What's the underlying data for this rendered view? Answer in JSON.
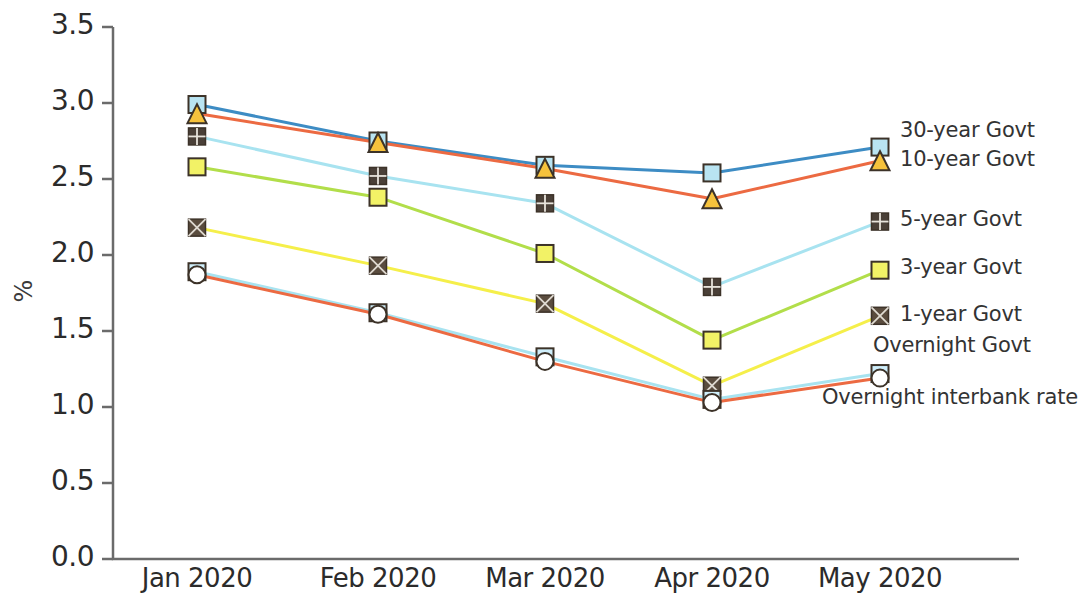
{
  "chart_data": {
    "type": "line",
    "title": "",
    "xlabel": "",
    "ylabel": "%",
    "categories": [
      "Jan 2020",
      "Feb 2020",
      "Mar 2020",
      "Apr 2020",
      "May 2020"
    ],
    "ylim": [
      0.0,
      3.5
    ],
    "yticks": [
      "0.0",
      "0.5",
      "1.0",
      "1.5",
      "2.0",
      "2.5",
      "3.0",
      "3.5"
    ],
    "ytick_values": [
      0.0,
      0.5,
      1.0,
      1.5,
      2.0,
      2.5,
      3.0,
      3.5
    ],
    "grid": false,
    "legend_position": "right",
    "series": [
      {
        "name": "30-year Govt",
        "color": "#3d8cc4",
        "marker": "square",
        "marker_fill": "#b9e4f2",
        "values": [
          2.99,
          2.75,
          2.59,
          2.54,
          2.71
        ]
      },
      {
        "name": "10-year Govt",
        "color": "#ec6a42",
        "marker": "triangle",
        "marker_fill": "#f6c23c",
        "values": [
          2.93,
          2.74,
          2.57,
          2.37,
          2.62
        ]
      },
      {
        "name": "5-year Govt",
        "color": "#a8e3f0",
        "marker": "grid-square",
        "marker_fill": "#4a4038",
        "values": [
          2.78,
          2.52,
          2.34,
          1.79,
          2.22
        ]
      },
      {
        "name": "3-year Govt",
        "color": "#b2de4a",
        "marker": "square",
        "marker_fill": "#f2f266",
        "values": [
          2.58,
          2.38,
          2.01,
          1.44,
          1.9
        ]
      },
      {
        "name": "1-year Govt",
        "color": "#f5ef4a",
        "marker": "cross-square",
        "marker_fill": "#5a4c3e",
        "values": [
          2.18,
          1.93,
          1.68,
          1.14,
          1.6
        ]
      },
      {
        "name": "Overnight Govt",
        "color": "#a8e3f0",
        "marker": "square",
        "marker_fill": "#cfeefa",
        "values": [
          1.89,
          1.62,
          1.33,
          1.05,
          1.22
        ]
      },
      {
        "name": "Overnight interbank rate",
        "color": "#ec6a42",
        "marker": "circle",
        "marker_fill": "#ffffff",
        "values": [
          1.87,
          1.61,
          1.3,
          1.03,
          1.19
        ]
      }
    ],
    "legend_entries": [
      {
        "label": "30-year Govt",
        "marker": "none"
      },
      {
        "label": "10-year Govt",
        "marker": "none"
      },
      {
        "label": "5-year Govt",
        "marker": "grid-square"
      },
      {
        "label": "3-year Govt",
        "marker": "square"
      },
      {
        "label": "1-year Govt",
        "marker": "cross-square"
      },
      {
        "label": "Overnight Govt",
        "marker": "none"
      },
      {
        "label": "Overnight interbank rate",
        "marker": "none"
      }
    ]
  },
  "axes": {
    "y_axis_label": "%"
  }
}
